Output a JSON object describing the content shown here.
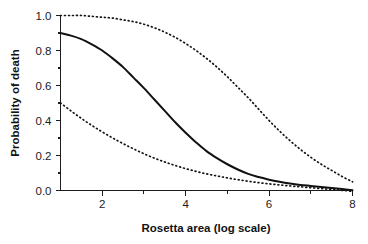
{
  "chart_data": {
    "type": "line",
    "title": "",
    "subtitle": "",
    "xlabel": "Rosetta area (log scale)",
    "ylabel": "Probability of death",
    "xlim": [
      1,
      8
    ],
    "ylim": [
      -0.04,
      1.03
    ],
    "grid": false,
    "legend_position": "none",
    "x_major_ticks": [
      2,
      4,
      6,
      8
    ],
    "x_minor_ticks": [
      3,
      5,
      7
    ],
    "x_tick_labels": [
      "2",
      "4",
      "6",
      "8"
    ],
    "y_major_ticks": [
      0.0,
      0.2,
      0.4,
      0.6,
      0.8,
      1.0
    ],
    "y_minor_ticks": [
      0.1,
      0.3,
      0.5,
      0.7,
      0.9
    ],
    "y_tick_labels": [
      "0.0",
      "0.2",
      "0.4",
      "0.6",
      "0.8",
      "1.0"
    ],
    "x": [
      1.0,
      1.25,
      1.5,
      1.75,
      2.0,
      2.25,
      2.5,
      2.75,
      3.0,
      3.25,
      3.5,
      3.75,
      4.0,
      4.25,
      4.5,
      4.75,
      5.0,
      5.25,
      5.5,
      5.75,
      6.0,
      6.25,
      6.5,
      6.75,
      7.0,
      7.25,
      7.5,
      7.75,
      8.0
    ],
    "series": [
      {
        "name": "Upper confidence limit",
        "style": "dotted",
        "color": "#141414",
        "values": [
          1.0,
          1.0,
          1.0,
          0.995,
          0.99,
          0.985,
          0.975,
          0.965,
          0.95,
          0.93,
          0.905,
          0.875,
          0.84,
          0.8,
          0.755,
          0.705,
          0.65,
          0.59,
          0.53,
          0.465,
          0.4,
          0.34,
          0.285,
          0.235,
          0.19,
          0.15,
          0.115,
          0.08,
          0.05
        ]
      },
      {
        "name": "Fitted probability of death",
        "style": "solid",
        "color": "#111111",
        "values": [
          0.9,
          0.885,
          0.865,
          0.835,
          0.8,
          0.755,
          0.705,
          0.645,
          0.585,
          0.52,
          0.455,
          0.39,
          0.33,
          0.275,
          0.225,
          0.185,
          0.15,
          0.12,
          0.095,
          0.077,
          0.062,
          0.05,
          0.04,
          0.032,
          0.026,
          0.02,
          0.014,
          0.008,
          0.002
        ]
      },
      {
        "name": "Lower confidence limit",
        "style": "dotted",
        "color": "#141414",
        "values": [
          0.5,
          0.455,
          0.412,
          0.372,
          0.335,
          0.3,
          0.268,
          0.238,
          0.21,
          0.185,
          0.163,
          0.143,
          0.125,
          0.109,
          0.095,
          0.083,
          0.072,
          0.062,
          0.053,
          0.045,
          0.038,
          0.032,
          0.026,
          0.021,
          0.016,
          0.011,
          0.006,
          0.001,
          -0.005
        ]
      }
    ]
  }
}
